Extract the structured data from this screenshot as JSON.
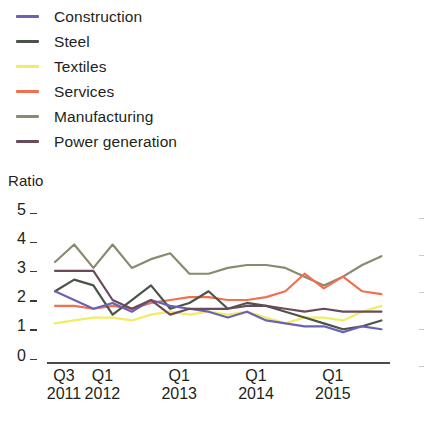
{
  "chart_data": {
    "type": "line",
    "title": "",
    "xlabel": "",
    "ylabel": "Ratio",
    "ylim": [
      0,
      5
    ],
    "yticks": [
      0,
      1,
      2,
      3,
      4,
      5
    ],
    "grid": false,
    "legend_position": "top-left",
    "x_tick_labels": [
      {
        "quarter": "Q3",
        "year": "2011"
      },
      {
        "quarter": "Q1",
        "year": "2012"
      },
      {
        "quarter": "Q1",
        "year": "2013"
      },
      {
        "quarter": "Q1",
        "year": "2014"
      },
      {
        "quarter": "Q1",
        "year": "2015"
      }
    ],
    "x": [
      "Q3 2011",
      "Q4 2011",
      "Q1 2012",
      "Q2 2012",
      "Q3 2012",
      "Q4 2012",
      "Q1 2013",
      "Q2 2013",
      "Q3 2013",
      "Q4 2013",
      "Q1 2014",
      "Q2 2014",
      "Q3 2014",
      "Q4 2014",
      "Q1 2015",
      "Q2 2015",
      "Q3 2015",
      "Q4 2015"
    ],
    "series": [
      {
        "name": "Construction",
        "color": "#6b62b5",
        "values": [
          2.2,
          1.9,
          1.6,
          1.8,
          1.5,
          1.9,
          1.7,
          1.6,
          1.5,
          1.3,
          1.5,
          1.2,
          1.1,
          1.0,
          1.0,
          0.8,
          1.0,
          0.9
        ]
      },
      {
        "name": "Steel",
        "color": "#4a5449",
        "values": [
          2.2,
          2.6,
          2.4,
          1.4,
          1.9,
          2.4,
          1.6,
          1.8,
          2.2,
          1.6,
          1.8,
          1.7,
          1.5,
          1.3,
          1.1,
          0.9,
          1.0,
          1.2
        ]
      },
      {
        "name": "Textiles",
        "color": "#f2ec63",
        "values": [
          1.1,
          1.2,
          1.3,
          1.3,
          1.2,
          1.4,
          1.5,
          1.4,
          1.5,
          1.4,
          1.5,
          1.3,
          1.1,
          1.3,
          1.3,
          1.2,
          1.5,
          1.7
        ]
      },
      {
        "name": "Services",
        "color": "#f07050",
        "values": [
          1.7,
          1.7,
          1.6,
          1.7,
          1.6,
          1.8,
          1.9,
          2.0,
          2.0,
          1.9,
          1.9,
          2.0,
          2.2,
          2.8,
          2.3,
          2.7,
          2.2,
          2.1
        ]
      },
      {
        "name": "Manufacturing",
        "color": "#8a8a70",
        "values": [
          3.2,
          3.8,
          3.0,
          3.8,
          3.0,
          3.3,
          3.5,
          2.8,
          2.8,
          3.0,
          3.1,
          3.1,
          3.0,
          2.7,
          2.4,
          2.7,
          3.1,
          3.4
        ]
      },
      {
        "name": "Power generation",
        "color": "#6b4a5a",
        "values": [
          2.9,
          2.9,
          2.9,
          1.9,
          1.6,
          1.9,
          1.4,
          1.6,
          1.6,
          1.6,
          1.7,
          1.7,
          1.6,
          1.5,
          1.6,
          1.5,
          1.5,
          1.5
        ]
      }
    ]
  },
  "legend": {
    "items": [
      {
        "label": "Construction"
      },
      {
        "label": "Steel"
      },
      {
        "label": "Textiles"
      },
      {
        "label": "Services"
      },
      {
        "label": "Manufacturing"
      },
      {
        "label": "Power generation"
      }
    ]
  },
  "axis": {
    "y_title": "Ratio"
  }
}
